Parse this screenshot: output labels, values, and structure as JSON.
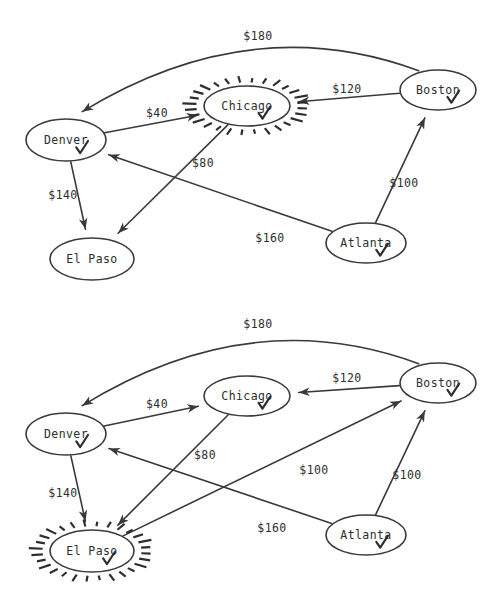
{
  "figure": {
    "title": "",
    "panels": [
      {
        "id": "panel-top",
        "name": "graph-step-1",
        "nodes": [
          {
            "id": "denver",
            "label": "Denver",
            "cx": 66,
            "cy": 140,
            "rx": 40,
            "ry": 21,
            "visited": true,
            "highlighted": false
          },
          {
            "id": "chicago",
            "label": "Chicago",
            "cx": 247,
            "cy": 106,
            "rx": 43,
            "ry": 20,
            "visited": true,
            "highlighted": true
          },
          {
            "id": "boston",
            "label": "Boston",
            "cx": 438,
            "cy": 90,
            "rx": 38,
            "ry": 20,
            "visited": true,
            "highlighted": false
          },
          {
            "id": "elpaso",
            "label": "El Paso",
            "cx": 92,
            "cy": 259,
            "rx": 42,
            "ry": 21,
            "visited": false,
            "highlighted": false
          },
          {
            "id": "atlanta",
            "label": "Atlanta",
            "cx": 366,
            "cy": 243,
            "rx": 40,
            "ry": 20,
            "visited": true,
            "highlighted": false
          }
        ],
        "edges": [
          {
            "id": "boston-denver",
            "from": "boston",
            "to": "denver",
            "label": "$180",
            "lx": 258,
            "ly": 36,
            "curved": true
          },
          {
            "id": "denver-chicago",
            "from": "denver",
            "to": "chicago",
            "label": "$40",
            "lx": 157,
            "ly": 113,
            "curved": false
          },
          {
            "id": "boston-chicago",
            "from": "boston",
            "to": "chicago",
            "label": "$120",
            "lx": 347,
            "ly": 89,
            "curved": false
          },
          {
            "id": "chicago-elpaso",
            "from": "chicago",
            "to": "elpaso",
            "label": "$80",
            "lx": 203,
            "ly": 163,
            "curved": false
          },
          {
            "id": "denver-elpaso",
            "from": "denver",
            "to": "elpaso",
            "label": "$140",
            "lx": 63,
            "ly": 195,
            "curved": false
          },
          {
            "id": "atlanta-denver",
            "from": "atlanta",
            "to": "denver",
            "label": "$160",
            "lx": 270,
            "ly": 238,
            "curved": false
          },
          {
            "id": "atlanta-boston",
            "from": "atlanta",
            "to": "boston",
            "label": "$100",
            "lx": 404,
            "ly": 183,
            "curved": false
          }
        ]
      },
      {
        "id": "panel-bottom",
        "name": "graph-step-2",
        "nodes": [
          {
            "id": "denver",
            "label": "Denver",
            "cx": 66,
            "cy": 434,
            "rx": 40,
            "ry": 21,
            "visited": true,
            "highlighted": false
          },
          {
            "id": "chicago",
            "label": "Chicago",
            "cx": 247,
            "cy": 396,
            "rx": 43,
            "ry": 20,
            "visited": true,
            "highlighted": false
          },
          {
            "id": "boston",
            "label": "Boston",
            "cx": 438,
            "cy": 383,
            "rx": 38,
            "ry": 20,
            "visited": true,
            "highlighted": false
          },
          {
            "id": "elpaso",
            "label": "El Paso",
            "cx": 92,
            "cy": 551,
            "rx": 42,
            "ry": 21,
            "visited": true,
            "highlighted": true
          },
          {
            "id": "atlanta",
            "label": "Atlanta",
            "cx": 366,
            "cy": 535,
            "rx": 40,
            "ry": 20,
            "visited": true,
            "highlighted": false
          }
        ],
        "edges": [
          {
            "id": "boston-denver",
            "from": "boston",
            "to": "denver",
            "label": "$180",
            "lx": 258,
            "ly": 324,
            "curved": true
          },
          {
            "id": "denver-chicago",
            "from": "denver",
            "to": "chicago",
            "label": "$40",
            "lx": 157,
            "ly": 404,
            "curved": false
          },
          {
            "id": "boston-chicago",
            "from": "boston",
            "to": "chicago",
            "label": "$120",
            "lx": 347,
            "ly": 378,
            "curved": false
          },
          {
            "id": "chicago-elpaso",
            "from": "chicago",
            "to": "elpaso",
            "label": "$80",
            "lx": 205,
            "ly": 455,
            "curved": false
          },
          {
            "id": "denver-elpaso",
            "from": "denver",
            "to": "elpaso",
            "label": "$140",
            "lx": 63,
            "ly": 493,
            "curved": false
          },
          {
            "id": "atlanta-denver",
            "from": "atlanta",
            "to": "denver",
            "label": "$160",
            "lx": 272,
            "ly": 528,
            "curved": false
          },
          {
            "id": "atlanta-boston",
            "from": "atlanta",
            "to": "boston",
            "label": "$100",
            "lx": 407,
            "ly": 475,
            "curved": false
          },
          {
            "id": "elpaso-boston",
            "from": "elpaso",
            "to": "boston",
            "label": "$100",
            "lx": 314,
            "ly": 470,
            "curved": false
          }
        ]
      }
    ]
  },
  "style": {
    "stroke_color": "#3a3a3a",
    "text_color": "#2e2e2e",
    "background": "#ffffff",
    "highlight_marker": "sparkle-rays",
    "visited_marker": "check-mark"
  },
  "chart_data": {
    "type": "diagram",
    "subtype": "directed-weighted-graph",
    "nodes": [
      "Denver",
      "Chicago",
      "Boston",
      "El Paso",
      "Atlanta"
    ],
    "edges": [
      {
        "from": "Boston",
        "to": "Denver",
        "weight": 180
      },
      {
        "from": "Denver",
        "to": "Chicago",
        "weight": 40
      },
      {
        "from": "Boston",
        "to": "Chicago",
        "weight": 120
      },
      {
        "from": "Chicago",
        "to": "El Paso",
        "weight": 80
      },
      {
        "from": "Denver",
        "to": "El Paso",
        "weight": 140
      },
      {
        "from": "Atlanta",
        "to": "Denver",
        "weight": 160
      },
      {
        "from": "Atlanta",
        "to": "Boston",
        "weight": 100
      },
      {
        "from": "El Paso",
        "to": "Boston",
        "weight": 100
      }
    ],
    "panels": [
      {
        "step": 1,
        "current_node": "Chicago",
        "visited": [
          "Denver",
          "Chicago",
          "Boston",
          "Atlanta"
        ],
        "unvisited": [
          "El Paso"
        ],
        "edges_shown": 7
      },
      {
        "step": 2,
        "current_node": "El Paso",
        "visited": [
          "Denver",
          "Chicago",
          "Boston",
          "Atlanta",
          "El Paso"
        ],
        "unvisited": [],
        "edges_shown": 8
      }
    ]
  }
}
